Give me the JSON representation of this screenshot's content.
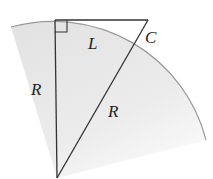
{
  "diagram": {
    "type": "geometry",
    "colors": {
      "sector_fill": "#e6e6e6",
      "arc_stroke": "#9a9a9a",
      "line_stroke": "#333333",
      "background": "#ffffff"
    },
    "labels": {
      "vertical_radius": "R",
      "tangent_segment": "L",
      "point_c": "C",
      "hypotenuse_radius": "R"
    },
    "elements": [
      {
        "id": "sector",
        "kind": "circular-sector",
        "center": "bottom vertex"
      },
      {
        "id": "vertical-leg",
        "kind": "segment",
        "label": "R"
      },
      {
        "id": "top-leg",
        "kind": "segment",
        "label": "L"
      },
      {
        "id": "hypotenuse",
        "kind": "segment",
        "label": "R"
      },
      {
        "id": "right-angle-marker",
        "kind": "marker",
        "at": "top-left vertex"
      },
      {
        "id": "point-c",
        "kind": "point",
        "label": "C"
      }
    ]
  }
}
